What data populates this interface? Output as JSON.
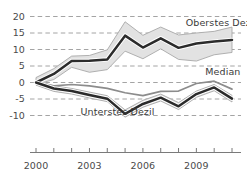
{
  "chart_data": {
    "type": "line",
    "title": "",
    "subtitle": "",
    "xlabel": "",
    "ylabel": "",
    "xlim": [
      2000,
      2011
    ],
    "ylim": [
      -11.5,
      21
    ],
    "yticks": [
      20,
      15,
      10,
      5,
      0,
      -5,
      -10
    ],
    "ytick_labels": [
      "20",
      "15",
      "10",
      "5",
      "0",
      "-5",
      "-10"
    ],
    "xticks": [
      2000,
      2001,
      2002,
      2003,
      2004,
      2005,
      2006,
      2007,
      2008,
      2009,
      2010,
      2011
    ],
    "xtick_labels_shown": [
      "2000",
      "2003",
      "2006",
      "2009"
    ],
    "xtick_labels_shown_at": [
      2000,
      2003,
      2006,
      2009
    ],
    "grid": "horizontal-dashed",
    "legend_position": "inline-annotations",
    "x": [
      2000,
      2001,
      2002,
      2003,
      2004,
      2005,
      2006,
      2007,
      2008,
      2009,
      2010,
      2011
    ],
    "series": [
      {
        "name": "Oberstes Dezil",
        "style": "thick-dark-line-with-grey-band",
        "values": [
          0.0,
          2.6,
          6.5,
          6.6,
          7.0,
          14.2,
          10.6,
          13.4,
          10.5,
          11.8,
          12.4,
          12.9
        ],
        "band_upper": [
          1.5,
          4.2,
          8.0,
          8.2,
          9.9,
          18.4,
          14.3,
          16.8,
          14.4,
          15.0,
          15.5,
          16.8
        ],
        "band_lower": [
          -0.6,
          0.9,
          4.6,
          3.1,
          3.9,
          9.5,
          7.2,
          10.2,
          7.0,
          6.5,
          8.4,
          9.1
        ]
      },
      {
        "name": "Median",
        "style": "medium-grey-line",
        "values": [
          0.0,
          -1.0,
          -0.6,
          -1.0,
          -1.8,
          -3.1,
          -4.0,
          -2.7,
          -2.6,
          -0.3,
          0.4,
          -2.0
        ]
      },
      {
        "name": "Unterstes Dezil",
        "style": "thick-dark-line-with-grey-band",
        "values": [
          0.0,
          -1.8,
          -2.6,
          -3.8,
          -4.9,
          -9.5,
          -6.5,
          -4.6,
          -7.2,
          -3.5,
          -1.5,
          -4.9
        ],
        "band_upper": [
          0.6,
          -1.0,
          -1.8,
          -2.9,
          -4.0,
          -8.3,
          -5.4,
          -3.5,
          -6.1,
          -2.6,
          -0.6,
          -3.9
        ],
        "band_lower": [
          -0.8,
          -2.7,
          -3.5,
          -4.7,
          -5.8,
          -10.5,
          -7.5,
          -5.6,
          -8.2,
          -4.5,
          -2.5,
          -5.9
        ]
      }
    ],
    "annotations": [
      {
        "text": "Oberstes Dezil",
        "x": 2008.4,
        "y": 18.0
      },
      {
        "text": "Median",
        "x": 2009.5,
        "y": 3.2
      },
      {
        "text": "Unterstes Dezil",
        "x": 2002.5,
        "y": -8.8
      }
    ],
    "colors": {
      "line_dark": "#2b2b2b",
      "line_grey": "#8c8c8c",
      "band_fill": "#e2e2e2",
      "band_edge": "#a8a8a8",
      "grid": "#9a9a9a",
      "axis": "#7a7a7a",
      "text": "#4a4a4a",
      "background": "#ffffff"
    }
  },
  "axes": {
    "y_labels": [
      {
        "value": "20"
      },
      {
        "value": "15"
      },
      {
        "value": "10"
      },
      {
        "value": "5"
      },
      {
        "value": "0"
      },
      {
        "value": "-5"
      },
      {
        "value": "-10"
      }
    ],
    "x_labels": [
      {
        "value": "2000"
      },
      {
        "value": "2003"
      },
      {
        "value": "2006"
      },
      {
        "value": "2009"
      }
    ]
  },
  "labels": {
    "top_decile": "Oberstes Dezil",
    "median": "Median",
    "bottom_decile": "Unterstes Dezil"
  }
}
